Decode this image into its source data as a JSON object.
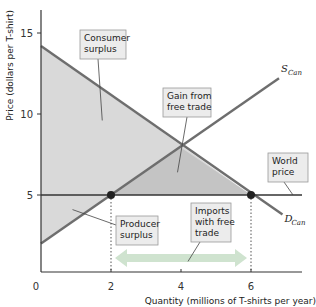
{
  "chart_data": {
    "type": "line",
    "title": "",
    "xlabel": "Quantity (millions of T-shirts per year)",
    "ylabel": "Price (dollars per T-shirt)",
    "xlim": [
      0,
      7.8
    ],
    "ylim": [
      0,
      16.5
    ],
    "x_ticks": [
      {
        "value": 0,
        "label": "0"
      },
      {
        "value": 2,
        "label": "2"
      },
      {
        "value": 4,
        "label": "4"
      },
      {
        "value": 6,
        "label": "6"
      }
    ],
    "y_ticks": [
      {
        "value": 5,
        "label": "5"
      },
      {
        "value": 10,
        "label": "10"
      },
      {
        "value": 15,
        "label": "15"
      }
    ],
    "grid": false,
    "series": [
      {
        "name": "D_Can",
        "label_main": "D",
        "label_sub": "Can",
        "points": [
          [
            0,
            14.2
          ],
          [
            6.9,
            3.8
          ]
        ],
        "color": "#6e6e6e"
      },
      {
        "name": "S_Can",
        "label_main": "S",
        "label_sub": "Can",
        "points": [
          [
            0,
            2.0
          ],
          [
            6.8,
            12.2
          ]
        ],
        "color": "#6e6e6e"
      },
      {
        "name": "World price",
        "points": [
          [
            0,
            5
          ],
          [
            7.8,
            5
          ]
        ],
        "color": "#333333"
      }
    ],
    "points": [
      {
        "name": "domestic-supply-at-world-price",
        "x": 2,
        "y": 5
      },
      {
        "name": "domestic-demand-at-world-price",
        "x": 6,
        "y": 5
      }
    ],
    "regions": [
      {
        "name": "Consumer surplus",
        "polygon": [
          [
            0,
            14.2
          ],
          [
            6,
            5
          ],
          [
            0,
            5
          ]
        ],
        "color": "#d9d9d9"
      },
      {
        "name": "Producer surplus",
        "polygon": [
          [
            0,
            2.0
          ],
          [
            2,
            5
          ],
          [
            0,
            5
          ]
        ],
        "color": "#d9d9d9"
      },
      {
        "name": "Gain from free trade",
        "polygon": [
          [
            2,
            5
          ],
          [
            3.95,
            8.0
          ],
          [
            6,
            5
          ]
        ],
        "color": "#c4c4c4"
      }
    ],
    "annotations": [
      {
        "name": "consumer-surplus",
        "lines": [
          "Consumer",
          "surplus"
        ],
        "target": [
          1.75,
          9.6
        ]
      },
      {
        "name": "gain-from-free-trade",
        "lines": [
          "Gain from",
          "free trade"
        ],
        "target": [
          3.9,
          6.4
        ]
      },
      {
        "name": "world-price",
        "lines": [
          "World",
          "price"
        ],
        "target": [
          7.2,
          5
        ]
      },
      {
        "name": "producer-surplus",
        "lines": [
          "Producer",
          "surplus"
        ],
        "target": [
          0.9,
          4.1
        ]
      },
      {
        "name": "imports-with-free-trade",
        "lines": [
          "Imports",
          "with free",
          "trade"
        ],
        "target": [
          4.2,
          0.9
        ]
      }
    ],
    "imports_arrow": {
      "from": 2,
      "to": 6,
      "color": "#cfe3cf"
    }
  }
}
